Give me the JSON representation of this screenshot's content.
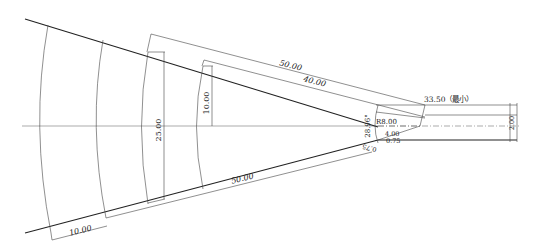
{
  "drawing": {
    "type": "technical-cad-drawing",
    "colors": {
      "line": "#222222",
      "background": "#ffffff"
    },
    "dimensions": {
      "top_outer_length": "50.00",
      "top_inner_length": "40.00",
      "bottom_length": "50.00",
      "bottom_left_segment": "10.00",
      "height_large": "25.00",
      "height_small": "10.00",
      "angle": "28.96°",
      "min_length": "33.50（最小）",
      "radius": "R8.00",
      "inner_width": "4.00",
      "offset_a": "0.75",
      "offset_b": "0.75",
      "right_height_a": "2.00",
      "right_height_b": "2.00"
    }
  }
}
